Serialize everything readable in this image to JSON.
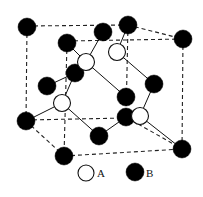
{
  "diagram": {
    "type": "crystal-structure",
    "legend": [
      {
        "symbol": "open-circle",
        "label": "A"
      },
      {
        "symbol": "filled-circle",
        "label": "B"
      }
    ],
    "atoms_A": [
      {
        "x": 86,
        "y": 62
      },
      {
        "x": 117,
        "y": 52
      },
      {
        "x": 62,
        "y": 103
      },
      {
        "x": 140,
        "y": 116
      }
    ],
    "atoms_B": [
      {
        "x": 27,
        "y": 27
      },
      {
        "x": 103,
        "y": 32
      },
      {
        "x": 128,
        "y": 25
      },
      {
        "x": 183,
        "y": 39
      },
      {
        "x": 67,
        "y": 43
      },
      {
        "x": 75,
        "y": 73
      },
      {
        "x": 47,
        "y": 86
      },
      {
        "x": 154,
        "y": 84
      },
      {
        "x": 126,
        "y": 97
      },
      {
        "x": 126,
        "y": 117
      },
      {
        "x": 26,
        "y": 121
      },
      {
        "x": 99,
        "y": 136
      },
      {
        "x": 182,
        "y": 149
      },
      {
        "x": 64,
        "y": 156
      }
    ],
    "legend_labels": {
      "a": "A",
      "b": "B"
    }
  }
}
